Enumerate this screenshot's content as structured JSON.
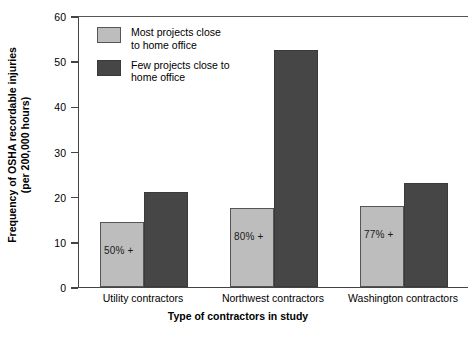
{
  "chart_data": {
    "type": "bar",
    "title": "",
    "xlabel": "Type of contractors in study",
    "ylabel": "Frequency of OSHA recordable injuries\n(per 200,000 hours)",
    "ylabel_line1": "Frequency of OSHA recordable injuries",
    "ylabel_line2": "(per 200,000 hours)",
    "categories": [
      "Utility contractors",
      "Northwest contractors",
      "Washington contractors"
    ],
    "series": [
      {
        "name": "Most projects close to home office",
        "name_line1": "Most projects close",
        "name_line2": "to home office",
        "color": "#bdbdbd",
        "values": [
          14.5,
          17.5,
          18
        ],
        "annotations": [
          "50% +",
          "80% +",
          "77% +"
        ]
      },
      {
        "name": "Few projects close to home office",
        "name_line1": "Few projects close to",
        "name_line2": "home office",
        "color": "#464646",
        "values": [
          21,
          52.5,
          23
        ],
        "annotations": [
          "",
          "",
          ""
        ]
      }
    ],
    "ylim": [
      0,
      60
    ],
    "yticks": [
      0,
      10,
      20,
      30,
      40,
      50,
      60
    ],
    "yticklabels": [
      "0",
      "10",
      "20",
      "30",
      "40",
      "50",
      "60"
    ],
    "grid": false,
    "legend_position": "upper left"
  }
}
